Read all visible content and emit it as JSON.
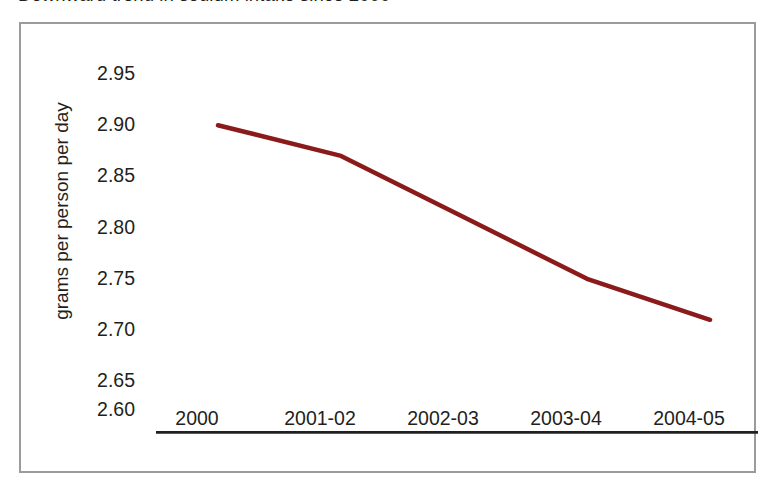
{
  "chart_title": "Downward trend in sodium intake since 2000",
  "axis_title_y": "grams per person per day",
  "chart_data": {
    "type": "line",
    "title": "Downward trend in sodium intake since 2000",
    "xlabel": "",
    "ylabel": "grams per person per day",
    "categories": [
      "2000",
      "2001-02",
      "2002-03",
      "2003-04",
      "2004-05"
    ],
    "values": [
      2.9,
      2.87,
      2.81,
      2.75,
      2.71
    ],
    "series": [
      {
        "name": "sodium intake",
        "values": [
          2.9,
          2.87,
          2.81,
          2.75,
          2.71
        ],
        "color": "#8B1A1A"
      }
    ],
    "ylim": [
      2.6,
      2.95
    ],
    "ytick_labels": [
      "2.95",
      "2.90",
      "2.85",
      "2.80",
      "2.75",
      "2.70",
      "2.65",
      "2.60"
    ],
    "ytick_values": [
      2.95,
      2.9,
      2.85,
      2.8,
      2.75,
      2.7,
      2.65,
      2.6
    ],
    "grid": false,
    "legend": "none",
    "line_width_px": 4.5,
    "axis_color": "#231f20",
    "frame_color": "#9b9b9b",
    "background": "#ffffff"
  }
}
